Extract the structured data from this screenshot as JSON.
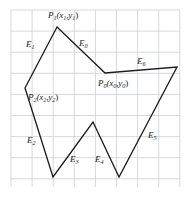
{
  "figure": {
    "name": "polygon-edge-vertex-diagram",
    "background_color": "#ffffff",
    "grid": {
      "visible": true,
      "color": "#c9cfd8",
      "cell_size": 21.1,
      "x0": 11,
      "y0": 10,
      "x1": 180,
      "y1": 187,
      "columns": 8,
      "rows": 8.4
    },
    "outline": {
      "color": "#1b1b1b",
      "width": 1.3,
      "closed": true,
      "vertices": [
        {
          "name": "P1",
          "x": 57,
          "y": 27
        },
        {
          "name": "P0",
          "x": 105,
          "y": 73
        },
        {
          "name": "V-right",
          "x": 177,
          "y": 67
        },
        {
          "name": "V-valley-right",
          "x": 119,
          "y": 177
        },
        {
          "name": "V-peak-mid",
          "x": 93,
          "y": 122
        },
        {
          "name": "V-valley-left",
          "x": 53,
          "y": 177
        },
        {
          "name": "P2",
          "x": 25,
          "y": 88
        }
      ]
    },
    "point_labels": [
      {
        "id": "P1",
        "base": "P",
        "sub": "1",
        "args": "(x",
        "sub_a": "1",
        "mid": ",y",
        "sub_b": "1",
        "close": ")",
        "x": 48,
        "y": 11
      },
      {
        "id": "P0",
        "base": "P",
        "sub": "0",
        "args": "(x",
        "sub_a": "0",
        "mid": ",y",
        "sub_b": "0",
        "close": ")",
        "x": 98,
        "y": 79
      },
      {
        "id": "P2",
        "base": "P",
        "sub": "2",
        "args": "(x",
        "sub_a": "2",
        "mid": ",y",
        "sub_b": "2",
        "close": ")",
        "x": 28,
        "y": 93
      }
    ],
    "edge_labels": [
      {
        "id": "E0",
        "base": "E",
        "sub": "0",
        "x": 79,
        "y": 39
      },
      {
        "id": "E1",
        "base": "E",
        "sub": "1",
        "x": 26,
        "y": 40
      },
      {
        "id": "E2",
        "base": "E",
        "sub": "2",
        "x": 27,
        "y": 136
      },
      {
        "id": "E3",
        "base": "E",
        "sub": "3",
        "x": 70,
        "y": 155
      },
      {
        "id": "E4",
        "base": "E",
        "sub": "4",
        "x": 95,
        "y": 155
      },
      {
        "id": "E5",
        "base": "E",
        "sub": "5",
        "x": 148,
        "y": 131
      },
      {
        "id": "E6",
        "base": "E",
        "sub": "6",
        "x": 137,
        "y": 57
      }
    ]
  }
}
